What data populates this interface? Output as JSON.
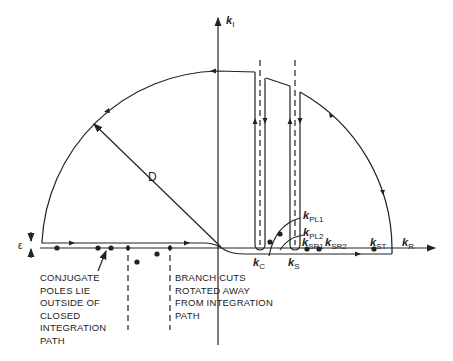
{
  "diagram": {
    "type": "contour-integration-path",
    "axes": {
      "imag_label": {
        "base": "k",
        "sub": "I"
      },
      "real_label": {
        "base": "k",
        "sub": "R"
      }
    },
    "radius_label": "D",
    "epsilon_label": "ε",
    "points": [
      {
        "base": "k",
        "sub": "C"
      },
      {
        "base": "k",
        "sub": "S"
      },
      {
        "base": "k",
        "sub": "PL1"
      },
      {
        "base": "k",
        "sub": "PL2"
      },
      {
        "base": "k",
        "sub": "SR1"
      },
      {
        "base": "k",
        "sub": "SR2"
      },
      {
        "base": "k",
        "sub": "ST"
      }
    ],
    "notes": {
      "conjugate_poles": [
        "CONJUGATE",
        "POLES LIE",
        "OUTSIDE OF",
        "CLOSED",
        "INTEGRATION",
        "PATH"
      ],
      "branch_cuts": [
        "BRANCH CUTS",
        "ROTATED AWAY",
        "FROM INTEGRATION",
        "PATH"
      ]
    },
    "colors": {
      "line": "#222222",
      "background": "#ffffff"
    }
  }
}
